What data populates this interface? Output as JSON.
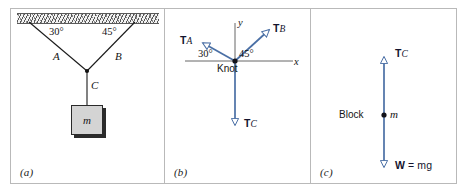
{
  "figure": {
    "panels": [
      {
        "id": "a",
        "label": "(a)",
        "name": "hanging-block-setup",
        "angle_left": "30°",
        "angle_right": "45°",
        "rope_left": "A",
        "rope_right": "B",
        "rope_down": "C",
        "block_mass": "m"
      },
      {
        "id": "b",
        "label": "(b)",
        "name": "knot-free-body-diagram",
        "axis_x": "x",
        "axis_y": "y",
        "origin_label": "Knot",
        "angle_left": "30°",
        "angle_right": "45°",
        "vectors": [
          {
            "name": "tension-a",
            "bold": "T",
            "sub": "A",
            "suffix": ""
          },
          {
            "name": "tension-b",
            "bold": "T",
            "sub": "B",
            "suffix": ""
          },
          {
            "name": "tension-c",
            "bold": "T",
            "sub": "C",
            "suffix": ""
          }
        ]
      },
      {
        "id": "c",
        "label": "(c)",
        "name": "block-free-body-diagram",
        "body_label": "Block",
        "body_mass": "m",
        "vectors": [
          {
            "name": "tension-c",
            "bold": "T",
            "sub": "C",
            "suffix": ""
          },
          {
            "name": "weight",
            "bold": "W",
            "sub": "",
            "suffix": " = mg"
          }
        ]
      }
    ],
    "colors": {
      "vector": "#4a6fa5",
      "vector_dark": "#3d5f92",
      "line": "#1a1a1a",
      "axis": "#555555",
      "panel_border": "#b9b9b9",
      "block_fill": "#d4d4d4"
    }
  }
}
